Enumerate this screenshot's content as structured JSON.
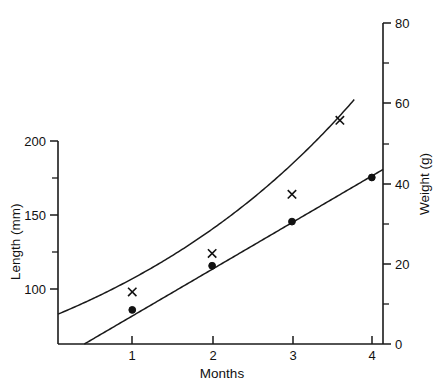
{
  "chart_data": {
    "type": "line",
    "title": "",
    "xlabel": "Months",
    "ylabel": "Length (mm)",
    "y2label": "Weight (g)",
    "xlim": [
      0.07,
      4.14
    ],
    "ylim": [
      75.0,
      200.0
    ],
    "y2lim": [
      0,
      80
    ],
    "grid": false,
    "legend": false,
    "x_ticks": [
      "1",
      "2",
      "3",
      "4"
    ],
    "x_tick_values": [
      1,
      2,
      3,
      4
    ],
    "y_ticks": [
      "100",
      "150",
      "200"
    ],
    "y_tick_values": [
      100,
      150,
      200
    ],
    "y_minor_tick_values": [
      125,
      175
    ],
    "y2_ticks": [
      "0",
      "20",
      "40",
      "60",
      "80"
    ],
    "y2_tick_values": [
      0,
      20,
      40,
      60,
      80
    ],
    "y2_minor_tick_values": [
      10,
      30,
      50,
      70
    ],
    "series": [
      {
        "name": "Length (mm)",
        "marker": "x",
        "axis": "left",
        "units": "mm",
        "x": [
          1,
          2,
          3,
          3.6
        ],
        "values": [
          98,
          124,
          164,
          214
        ]
      },
      {
        "name": "Weight (g)",
        "marker": "dot",
        "axis": "right",
        "units": "g",
        "x": [
          1,
          2,
          3,
          4
        ],
        "values": [
          8.5,
          19.5,
          30.5,
          41.5
        ]
      }
    ],
    "fit_curves": [
      {
        "name": "length-exponential-fit",
        "axis": "left",
        "style": "exponential",
        "x_start": 0.07,
        "x_end": 3.78,
        "y_start": 83,
        "y_end": 228
      },
      {
        "name": "weight-linear-fit",
        "axis": "right",
        "style": "linear",
        "x_start": 0.4,
        "x_end": 4.14,
        "y_start": 0,
        "y_end": 43.5
      }
    ]
  },
  "axes": {
    "left": {
      "title": "Length (mm)"
    },
    "right": {
      "title": "Weight (g)"
    },
    "bottom": {
      "title": "Months"
    }
  },
  "colors": {
    "ink": "#1a1a1a",
    "background": "#ffffff"
  }
}
